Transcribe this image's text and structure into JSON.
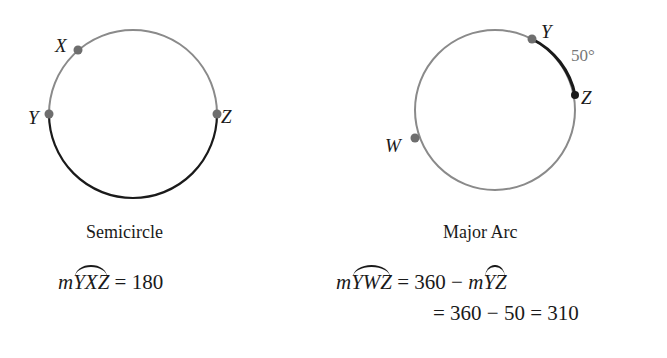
{
  "figures": [
    {
      "id": "semicircle",
      "caption": "Semicircle",
      "points": {
        "X": "X",
        "Y": "Y",
        "Z": "Z"
      },
      "equation": {
        "prefix": "m",
        "arc": "YXZ",
        "rest": " = 180"
      }
    },
    {
      "id": "major-arc",
      "caption": "Major Arc",
      "points": {
        "Y": "Y",
        "Z": "Z",
        "W": "W"
      },
      "arc_measure_label": "50°",
      "equation": {
        "line1_prefix": "m",
        "line1_arc": "YWZ",
        "line1_mid": " = 360 − ",
        "line1_prefix2": "m",
        "line1_arc2": "YZ",
        "line2": "= 360 − 50 = 310"
      }
    }
  ],
  "colors": {
    "light_arc": "#8a8a8a",
    "dark_arc": "#1a1a1a",
    "point": "#6e6e6e"
  }
}
